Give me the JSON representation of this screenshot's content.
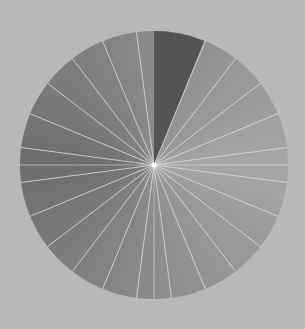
{
  "figure": {
    "background_color": "#b8b8b8",
    "highlight": {
      "start_deg": 0,
      "end_deg": 22,
      "color": "#545454"
    },
    "wedge_count": 24,
    "divider_color": "#d8d8d8",
    "center_dot_color": "#ffffff",
    "gradient_stops": [
      {
        "angle_deg": 0,
        "gray": "#8a8a8a"
      },
      {
        "angle_deg": 90,
        "gray": "#a6a6a6"
      },
      {
        "angle_deg": 180,
        "gray": "#8c8c8c"
      },
      {
        "angle_deg": 270,
        "gray": "#6e6e6e"
      },
      {
        "angle_deg": 360,
        "gray": "#8a8a8a"
      }
    ]
  }
}
